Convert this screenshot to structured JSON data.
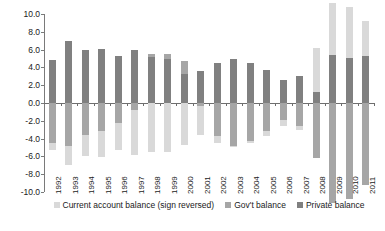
{
  "chart_data": {
    "type": "bar",
    "subtype": "stacked-bar",
    "title": "",
    "subtitle": "",
    "xlabel": "",
    "ylabel": "",
    "ylim": [
      -10.0,
      10.0
    ],
    "ytick_step": 2.0,
    "grid": false,
    "legend_position": "bottom",
    "categories": [
      "1992",
      "1993",
      "1994",
      "1995",
      "1996",
      "1997",
      "1998",
      "1999",
      "2000",
      "2001",
      "2002",
      "2003",
      "2004",
      "2005",
      "2006",
      "2007",
      "2008",
      "2009",
      "2010",
      "2011"
    ],
    "ytick_labels": [
      "10.0",
      "8.0",
      "6.0",
      "4.0",
      "2.0",
      "0.0",
      "-2.0",
      "-4.0",
      "-6.0",
      "-8.0",
      "-10.0"
    ],
    "series": [
      {
        "name": "Private balance",
        "color": "#808080",
        "values": [
          4.8,
          7.0,
          6.0,
          6.1,
          5.3,
          5.9,
          5.2,
          4.9,
          3.3,
          3.6,
          4.5,
          5.0,
          4.5,
          3.7,
          2.6,
          3.0,
          1.2,
          5.4,
          5.1,
          5.3
        ]
      },
      {
        "name": "Gov't balance",
        "color": "#a6a6a6",
        "values": [
          -4.5,
          -4.8,
          -3.6,
          -3.1,
          -2.2,
          -0.8,
          0.3,
          0.6,
          1.4,
          -0.3,
          -3.7,
          -4.8,
          -4.3,
          -3.2,
          -1.9,
          -2.6,
          -6.2,
          -11.2,
          -10.8,
          -9.2
        ]
      },
      {
        "name": "Current account balance (sign reversed)",
        "color": "#d9d9d9",
        "values": [
          -0.8,
          -2.2,
          -2.4,
          -3.0,
          -3.1,
          -5.1,
          -5.5,
          -5.5,
          -4.7,
          -3.3,
          -0.8,
          -0.2,
          -0.2,
          -0.5,
          -0.7,
          -0.4,
          5.0,
          5.8,
          5.7,
          3.9
        ]
      }
    ]
  },
  "legend": {
    "items": [
      {
        "label": "Current account balance (sign reversed)",
        "color": "#d9d9d9"
      },
      {
        "label": "Gov't balance",
        "color": "#a6a6a6"
      },
      {
        "label": "Private balance",
        "color": "#808080"
      }
    ]
  }
}
